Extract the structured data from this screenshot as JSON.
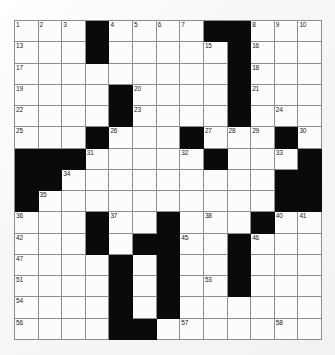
{
  "puzzle": {
    "type": "crossword-grid",
    "columns": 13,
    "rows": 15,
    "cell_size_px": 23.7,
    "colors": {
      "background": "#fbfbfa",
      "cell_fill": "#fcfcfb",
      "block_fill": "#0a0a0a",
      "grid_line": "#8d8d8d",
      "number_text": "#1a1a1a"
    },
    "highest_clue_number": 58,
    "grid_rows": [
      "...#....##...",
      "...#.....#...",
      ".........#...",
      "....#....#...",
      "....#....#...",
      "...#...#...#.",
      "###.....#...#",
      "##.........##",
      "#..........##",
      "...#..#...#..",
      "...#.##..#...",
      "....#.#..#...",
      "....#.#..#...",
      "....#.#......",
      "....##......."
    ],
    "numbered_cells": [
      {
        "n": 1,
        "row": 0,
        "col": 0
      },
      {
        "n": 2,
        "row": 0,
        "col": 1
      },
      {
        "n": 3,
        "row": 0,
        "col": 2
      },
      {
        "n": 4,
        "row": 0,
        "col": 4
      },
      {
        "n": 5,
        "row": 0,
        "col": 5
      },
      {
        "n": 6,
        "row": 0,
        "col": 6
      },
      {
        "n": 7,
        "row": 0,
        "col": 7
      },
      {
        "n": 8,
        "row": 0,
        "col": 10
      },
      {
        "n": 9,
        "row": 0,
        "col": 11
      },
      {
        "n": 10,
        "row": 0,
        "col": 12
      },
      {
        "n": 11,
        "row": 0,
        "col": 12
      },
      {
        "n": 12,
        "row": 0,
        "col": 12
      },
      {
        "n": 13,
        "row": 1,
        "col": 0
      },
      {
        "n": 14,
        "row": 1,
        "col": 3
      },
      {
        "n": 15,
        "row": 1,
        "col": 8
      },
      {
        "n": 16,
        "row": 1,
        "col": 10
      },
      {
        "n": 17,
        "row": 2,
        "col": 0
      },
      {
        "n": 18,
        "row": 2,
        "col": 10
      },
      {
        "n": 19,
        "row": 3,
        "col": 0
      },
      {
        "n": 20,
        "row": 3,
        "col": 5
      },
      {
        "n": 21,
        "row": 3,
        "col": 10
      },
      {
        "n": 22,
        "row": 4,
        "col": 0
      },
      {
        "n": 23,
        "row": 4,
        "col": 5
      },
      {
        "n": 24,
        "row": 4,
        "col": 11
      },
      {
        "n": 25,
        "row": 5,
        "col": 0
      },
      {
        "n": 26,
        "row": 5,
        "col": 4
      },
      {
        "n": 27,
        "row": 5,
        "col": 8
      },
      {
        "n": 28,
        "row": 5,
        "col": 9
      },
      {
        "n": 29,
        "row": 5,
        "col": 10
      },
      {
        "n": 30,
        "row": 5,
        "col": 12
      },
      {
        "n": 31,
        "row": 6,
        "col": 3
      },
      {
        "n": 32,
        "row": 6,
        "col": 7
      },
      {
        "n": 33,
        "row": 6,
        "col": 11
      },
      {
        "n": 34,
        "row": 7,
        "col": 2
      },
      {
        "n": 35,
        "row": 8,
        "col": 1
      },
      {
        "n": 36,
        "row": 9,
        "col": 0
      },
      {
        "n": 37,
        "row": 9,
        "col": 4
      },
      {
        "n": 38,
        "row": 9,
        "col": 8
      },
      {
        "n": 39,
        "row": 9,
        "col": 10
      },
      {
        "n": 40,
        "row": 9,
        "col": 11
      },
      {
        "n": 41,
        "row": 9,
        "col": 12
      },
      {
        "n": 42,
        "row": 10,
        "col": 0
      },
      {
        "n": 43,
        "row": 10,
        "col": 3
      },
      {
        "n": 44,
        "row": 10,
        "col": 6
      },
      {
        "n": 45,
        "row": 10,
        "col": 7
      },
      {
        "n": 46,
        "row": 10,
        "col": 10
      },
      {
        "n": 47,
        "row": 11,
        "col": 0
      },
      {
        "n": 48,
        "row": 11,
        "col": 4
      },
      {
        "n": 49,
        "row": 11,
        "col": 6
      },
      {
        "n": 50,
        "row": 11,
        "col": 9
      },
      {
        "n": 51,
        "row": 12,
        "col": 0
      },
      {
        "n": 52,
        "row": 12,
        "col": 6
      },
      {
        "n": 53,
        "row": 12,
        "col": 8
      },
      {
        "n": 54,
        "row": 13,
        "col": 0
      },
      {
        "n": 55,
        "row": 13,
        "col": 6
      },
      {
        "n": 56,
        "row": 14,
        "col": 0
      },
      {
        "n": 57,
        "row": 14,
        "col": 7
      },
      {
        "n": 58,
        "row": 14,
        "col": 11
      }
    ]
  }
}
